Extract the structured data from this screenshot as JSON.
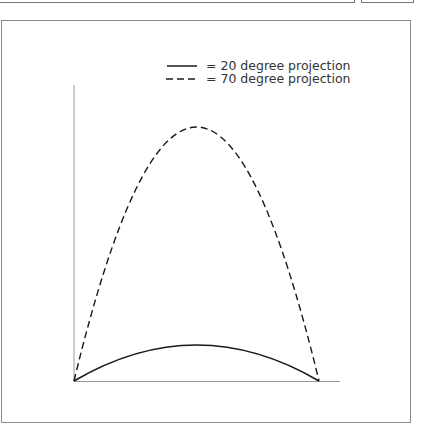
{
  "legend": {
    "items": [
      {
        "style": "solid",
        "label": "= 20 degree projection"
      },
      {
        "style": "dashed",
        "label": "= 70 degree projection"
      }
    ]
  },
  "diagram": {
    "type": "projectile-trajectories",
    "axes": {
      "x_label": "",
      "y_label": ""
    },
    "curves": [
      {
        "name": "20 degree projection",
        "style": "solid",
        "relative_peak_height": 0.12
      },
      {
        "name": "70 degree projection",
        "style": "dashed",
        "relative_peak_height": 0.86
      }
    ],
    "colors": {
      "line": "#1a1a1a",
      "axis": "#999999",
      "frame": "#8a8a8a"
    }
  }
}
